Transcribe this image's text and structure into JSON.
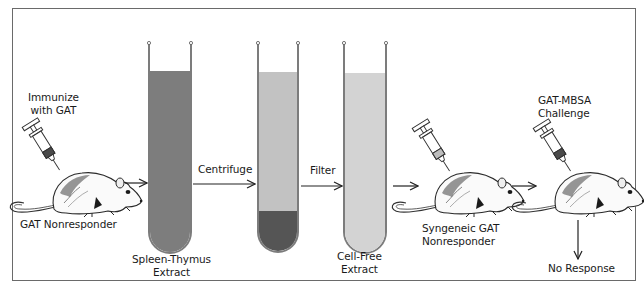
{
  "steps": {
    "immunize": {
      "line1": "Immunize",
      "line2": "with GAT"
    },
    "donor": {
      "label": "GAT Nonresponder"
    },
    "extract": {
      "line1": "Spleen-Thymus",
      "line2": "Extract"
    },
    "centrifuge": {
      "label": "Centrifuge"
    },
    "filter": {
      "label": "Filter"
    },
    "cell_free": {
      "line1": "Cell-Free",
      "line2": "Extract"
    },
    "recipient": {
      "line1": "Syngeneic GAT",
      "line2": "Nonresponder"
    },
    "challenge": {
      "line1": "GAT-MBSA",
      "line2": "Challenge"
    },
    "outcome": {
      "label": "No Response"
    }
  },
  "colors": {
    "frame": "#6a6a6a",
    "tube_wall": "#7c7c7c",
    "extract_fill": "#7d7d7d",
    "supernatant_fill": "#c2c2c2",
    "pellet_fill": "#555555",
    "cell_free_fill": "#d3d3d3",
    "syringe_light": "#bdbdbd",
    "syringe_dark": "#4a4a4a"
  }
}
